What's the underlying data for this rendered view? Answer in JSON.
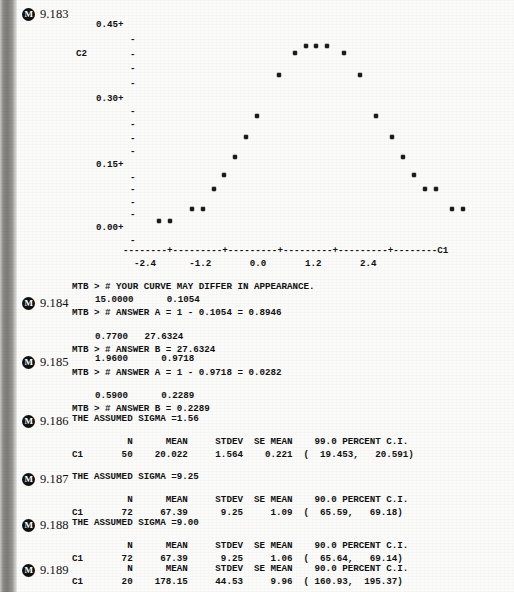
{
  "page": {
    "background_color": "#fbfbfa",
    "ink_color": "#111111"
  },
  "margin_markers": [
    {
      "icon": "circled-m-icon",
      "glyph": "M",
      "label": "9.183",
      "top": 7
    },
    {
      "icon": "circled-m-icon",
      "glyph": "M",
      "label": "9.184",
      "top": 296
    },
    {
      "icon": "circled-m-icon",
      "glyph": "M",
      "label": "9.185",
      "top": 355
    },
    {
      "icon": "circled-m-icon",
      "glyph": "M",
      "label": "9.186",
      "top": 414
    },
    {
      "icon": "circled-m-icon",
      "glyph": "M",
      "label": "9.187",
      "top": 472
    },
    {
      "icon": "circled-m-icon",
      "glyph": "M",
      "label": "9.188",
      "top": 518
    },
    {
      "icon": "circled-m-icon",
      "glyph": "M",
      "label": "9.189",
      "top": 563
    }
  ],
  "chart_data": {
    "type": "scatter",
    "title": "",
    "xlabel": "C1",
    "ylabel": "C2",
    "ylim": [
      0.0,
      0.45
    ],
    "xlim": [
      -3.0,
      3.0
    ],
    "yticks": [
      "0.45+",
      "0.30+",
      "0.15+",
      "0.00+"
    ],
    "ytick_values": [
      0.45,
      0.3,
      0.15,
      0.0
    ],
    "minor_tick_glyph": "-",
    "minor_ticks_between": 4,
    "xticklabels": [
      "-2.4",
      "-1.2",
      "0.0",
      "1.2",
      "2.4"
    ],
    "xtick_values": [
      -2.4,
      -1.2,
      0.0,
      1.2,
      2.4
    ],
    "axis_line": "--------+---------+---------+---------+---------+--------",
    "axis_end_label": "C1",
    "grid": false,
    "legend": null,
    "marker_glyph": "*",
    "points": [
      {
        "x": -2.8,
        "y": 0.008
      },
      {
        "x": -2.6,
        "y": 0.008
      },
      {
        "x": -2.2,
        "y": 0.036
      },
      {
        "x": -2.0,
        "y": 0.036
      },
      {
        "x": -1.8,
        "y": 0.079
      },
      {
        "x": -1.6,
        "y": 0.111
      },
      {
        "x": -1.4,
        "y": 0.15
      },
      {
        "x": -1.2,
        "y": 0.194
      },
      {
        "x": -1.0,
        "y": 0.242
      },
      {
        "x": -0.6,
        "y": 0.333
      },
      {
        "x": -0.3,
        "y": 0.381
      },
      {
        "x": -0.1,
        "y": 0.396
      },
      {
        "x": 0.1,
        "y": 0.396
      },
      {
        "x": 0.3,
        "y": 0.396
      },
      {
        "x": 0.6,
        "y": 0.381
      },
      {
        "x": 0.9,
        "y": 0.333
      },
      {
        "x": 1.2,
        "y": 0.242
      },
      {
        "x": 1.5,
        "y": 0.194
      },
      {
        "x": 1.7,
        "y": 0.15
      },
      {
        "x": 1.9,
        "y": 0.111
      },
      {
        "x": 2.1,
        "y": 0.079
      },
      {
        "x": 2.3,
        "y": 0.079
      },
      {
        "x": 2.6,
        "y": 0.036
      },
      {
        "x": 2.8,
        "y": 0.036
      }
    ]
  },
  "plot_labels": {
    "y_axis_name": "C2",
    "ytick_0": "0.45+",
    "ytick_1": "0.30+",
    "ytick_2": "0.15+",
    "ytick_3": "0.00+",
    "dash": "-",
    "axis_line": "--------+---------+---------+---------+---------+--------C1",
    "xticks_row": "  -2.4      -1.2       0.0       1.2       2.4"
  },
  "transcript": [
    {
      "id": "line-mtb-curve",
      "text": "MTB > # YOUR CURVE MAY DIFFER IN APPEARANCE.",
      "top": 281,
      "left": 72
    },
    {
      "id": "line-9184-vals",
      "text": "15.0000      0.1054",
      "top": 294,
      "left": 95
    },
    {
      "id": "line-9184-a",
      "text": "MTB > # ANSWER A = 1 - 0.1054 = 0.8946",
      "top": 307,
      "left": 72
    },
    {
      "id": "line-9184-vals2",
      "text": "0.7700   27.6324",
      "top": 331,
      "left": 95
    },
    {
      "id": "line-9184-b",
      "text": "MTB > # ANSWER B = 27.6324",
      "top": 344,
      "left": 72
    },
    {
      "id": "line-9185-vals",
      "text": "1.9600      0.9718",
      "top": 353,
      "left": 95
    },
    {
      "id": "line-9185-a",
      "text": "MTB > # ANSWER A = 1 - 0.9718 = 0.0282",
      "top": 367,
      "left": 72
    },
    {
      "id": "line-9185-vals2",
      "text": "0.5900      0.2289",
      "top": 390,
      "left": 95
    },
    {
      "id": "line-9185-b",
      "text": "MTB > # ANSWER B = 0.2289",
      "top": 403,
      "left": 72
    },
    {
      "id": "line-9186-sigma",
      "text": "THE ASSUMED SIGMA =1.56",
      "top": 413,
      "left": 72
    },
    {
      "id": "line-9187-sigma",
      "text": "THE ASSUMED SIGMA =9.25",
      "top": 471,
      "left": 72
    },
    {
      "id": "line-9188-sigma",
      "text": "THE ASSUMED SIGMA =9.00",
      "top": 517,
      "left": 72
    }
  ],
  "tables": [
    {
      "id": "ci-table-9186",
      "header_top": 436,
      "row_top": 449,
      "headers": "          N      MEAN     STDEV  SE MEAN    99.0 PERCENT C.I.",
      "row": "C1       50    20.022     1.564    0.221  (  19.453,   20.591)",
      "columns": [
        "",
        "N",
        "MEAN",
        "STDEV",
        "SE MEAN",
        "99.0 PERCENT C.I."
      ],
      "values": [
        "C1",
        "50",
        "20.022",
        "1.564",
        "0.221",
        "(  19.453,   20.591)"
      ]
    },
    {
      "id": "ci-table-9187",
      "header_top": 494,
      "row_top": 507,
      "headers": "          N      MEAN     STDEV  SE MEAN    90.0 PERCENT C.I.",
      "row": "C1       72     67.39      9.25     1.09  (  65.59,   69.18)",
      "columns": [
        "",
        "N",
        "MEAN",
        "STDEV",
        "SE MEAN",
        "90.0 PERCENT C.I."
      ],
      "values": [
        "C1",
        "72",
        "67.39",
        "9.25",
        "1.09",
        "(  65.59,   69.18)"
      ]
    },
    {
      "id": "ci-table-9188",
      "header_top": 540,
      "row_top": 553,
      "headers": "          N      MEAN     STDEV  SE MEAN    90.0 PERCENT C.I.",
      "row": "C1       72     67.39      9.25     1.06  (  65.64,   69.14)",
      "columns": [
        "",
        "N",
        "MEAN",
        "STDEV",
        "SE MEAN",
        "90.0 PERCENT C.I."
      ],
      "values": [
        "C1",
        "72",
        "67.39",
        "9.25",
        "1.06",
        "(  65.64,   69.14)"
      ]
    },
    {
      "id": "ci-table-9189",
      "header_top": 563,
      "row_top": 576,
      "headers": "          N      MEAN     STDEV  SE MEAN    90.0 PERCENT C.I.",
      "row": "C1       20    178.15     44.53     9.96  ( 160.93,  195.37)",
      "columns": [
        "",
        "N",
        "MEAN",
        "STDEV",
        "SE MEAN",
        "90.0 PERCENT C.I."
      ],
      "values": [
        "C1",
        "20",
        "178.15",
        "44.53",
        "9.96",
        "( 160.93,  195.37)"
      ]
    }
  ]
}
